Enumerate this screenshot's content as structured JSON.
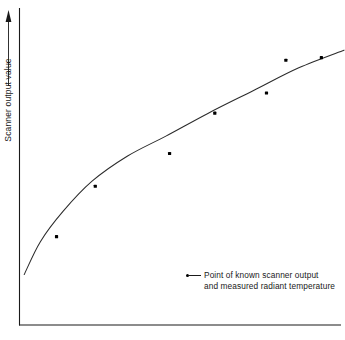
{
  "chart_data": {
    "type": "scatter",
    "title": "",
    "xlabel": "",
    "ylabel": "Scanner output value",
    "grid": false,
    "axis_arrows": true,
    "axes": {
      "x": {
        "labeled_ticks": false,
        "range_label": ""
      },
      "y": {
        "labeled_ticks": false,
        "range_label": ""
      }
    },
    "series": [
      {
        "name": "Point of known scanner output and measured radiant temperature",
        "type": "scatter",
        "marker": "filled-square-dot",
        "points": [
          {
            "x": 0.11,
            "y": 0.18
          },
          {
            "x": 0.23,
            "y": 0.38
          },
          {
            "x": 0.46,
            "y": 0.51
          },
          {
            "x": 0.6,
            "y": 0.67
          },
          {
            "x": 0.76,
            "y": 0.75
          },
          {
            "x": 0.82,
            "y": 0.88
          },
          {
            "x": 0.93,
            "y": 0.89
          }
        ]
      },
      {
        "name": "Fitted calibration curve",
        "type": "line",
        "points": [
          {
            "x": 0.01,
            "y": 0.03
          },
          {
            "x": 0.06,
            "y": 0.16
          },
          {
            "x": 0.13,
            "y": 0.28
          },
          {
            "x": 0.22,
            "y": 0.4
          },
          {
            "x": 0.33,
            "y": 0.5
          },
          {
            "x": 0.45,
            "y": 0.58
          },
          {
            "x": 0.58,
            "y": 0.67
          },
          {
            "x": 0.72,
            "y": 0.76
          },
          {
            "x": 0.86,
            "y": 0.85
          },
          {
            "x": 1.0,
            "y": 0.92
          }
        ]
      }
    ],
    "legend": {
      "position": "inside-bottom-right",
      "entries": [
        {
          "marker": "dot-with-line",
          "line1": "Point of known scanner output",
          "line2": "and measured radiant temperature"
        }
      ]
    }
  },
  "axis_titles": {
    "y": "Scanner output value"
  }
}
